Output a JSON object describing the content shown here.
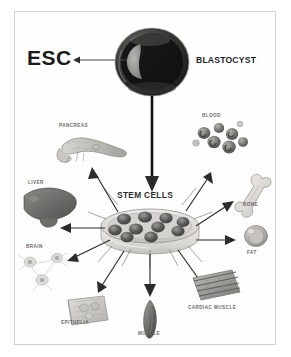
{
  "figure": {
    "title_label": "ESC",
    "source_label": "BLASTOCYST",
    "center_label": "STEM CELLS",
    "esc_arrow_name": "esc-pointer-arrow",
    "main_arrow_name": "blastocyst-to-stemcells-arrow",
    "background_color": "#ffffff",
    "frame_color": "#d3d3d3",
    "ink_color": "#2b2b2b"
  },
  "source": {
    "esc": "ESC",
    "blastocyst": "BLASTOCYST",
    "icm_note": "inner-cell-mass"
  },
  "center": {
    "label": "STEM CELLS",
    "dish_name": "petri-dish",
    "colony_count": 10
  },
  "derivatives": [
    {
      "id": "pancreas",
      "label": "PANCREAS",
      "icon": "pancreas-icon"
    },
    {
      "id": "blood",
      "label": "BLOOD",
      "icon": "blood-cells-icon"
    },
    {
      "id": "liver",
      "label": "LIVER",
      "icon": "liver-icon"
    },
    {
      "id": "bone",
      "label": "BONE",
      "icon": "bone-icon"
    },
    {
      "id": "brain",
      "label": "BRAIN",
      "icon": "neuron-icon"
    },
    {
      "id": "fat",
      "label": "FAT",
      "icon": "adipocyte-icon"
    },
    {
      "id": "epithelia",
      "label": "EPITHELIA",
      "icon": "epithelial-sheet-icon"
    },
    {
      "id": "muscle",
      "label": "MUSCLE",
      "icon": "muscle-fiber-icon"
    },
    {
      "id": "cardiac_muscle",
      "label": "CARDIAC MUSCLE",
      "icon": "cardiac-muscle-icon"
    }
  ]
}
